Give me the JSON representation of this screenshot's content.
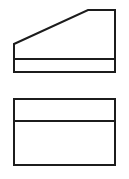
{
  "canvas": {
    "width": 129,
    "height": 179,
    "background": "#ffffff"
  },
  "style": {
    "stroke_color": "#1c1c1c",
    "stroke_width": 2,
    "fill": "none",
    "linejoin": "miter"
  },
  "drawing": {
    "kind": "orthographic-two-view-technical-drawing",
    "shapes": [
      {
        "name": "top-view-outline",
        "type": "polygon",
        "points": [
          [
            14,
            44
          ],
          [
            88,
            10
          ],
          [
            115,
            10
          ],
          [
            115,
            72
          ],
          [
            14,
            72
          ]
        ]
      },
      {
        "name": "top-view-horizontal-divider",
        "type": "line",
        "points": [
          [
            14,
            59
          ],
          [
            115,
            59
          ]
        ]
      },
      {
        "name": "front-view-outline",
        "type": "polygon",
        "points": [
          [
            14,
            99
          ],
          [
            115,
            99
          ],
          [
            115,
            165
          ],
          [
            14,
            165
          ]
        ]
      },
      {
        "name": "front-view-horizontal-divider",
        "type": "line",
        "points": [
          [
            14,
            121
          ],
          [
            115,
            121
          ]
        ]
      }
    ]
  }
}
